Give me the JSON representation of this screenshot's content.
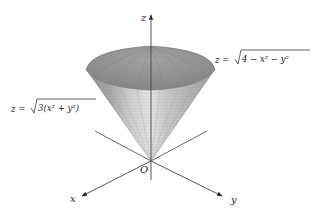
{
  "figure": {
    "axes": {
      "x_label": "x",
      "y_label": "y",
      "z_label": "z",
      "origin_label": "O"
    },
    "surfaces": {
      "sphere_label": {
        "lhs": "z =",
        "radicand": "4 − x² − y²"
      },
      "cone_label": {
        "lhs": "z =",
        "radicand": "3(x² + y²)"
      }
    },
    "colors": {
      "cap": "#8e8e8e",
      "cone_dark": "#9a9a9a",
      "cone_light": "#d6d6d6",
      "axis": "#444444"
    }
  }
}
